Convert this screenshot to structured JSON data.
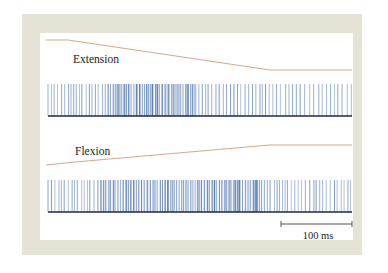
{
  "figure": {
    "panels": [
      {
        "id": "extension",
        "label": "Extension",
        "trace": {
          "color": "#d9a88a",
          "points": [
            [
              46,
              40
            ],
            [
              68,
              40
            ],
            [
              270,
              70
            ],
            [
              352,
              70
            ]
          ]
        },
        "spikes": {
          "color": "#5b7fb4",
          "baseline_color": "#1d2a44",
          "top": 84,
          "bottom": 116,
          "x_start": 48,
          "x_end": 352,
          "dense_region": [
            108,
            195
          ],
          "seed": 7
        }
      },
      {
        "id": "flexion",
        "label": "Flexion",
        "trace": {
          "color": "#d9a88a",
          "points": [
            [
              46,
              165
            ],
            [
              75,
              162
            ],
            [
              270,
              145
            ],
            [
              352,
              145
            ]
          ]
        },
        "spikes": {
          "color": "#5b7fb4",
          "baseline_color": "#1d2a44",
          "top": 180,
          "bottom": 212,
          "x_start": 48,
          "x_end": 352,
          "dense_region": [
            100,
            260
          ],
          "seed": 13
        }
      }
    ],
    "scale_bar": {
      "label": "100 ms",
      "x1": 281,
      "x2": 352,
      "y": 224,
      "color": "#555555"
    }
  },
  "chart_data": {
    "type": "line",
    "title": "",
    "series": [
      {
        "name": "Extension (joint position)",
        "shape": "flat, ramp down, flat"
      },
      {
        "name": "Flexion (joint position)",
        "shape": "flat, ramp up, flat"
      },
      {
        "name": "Extension spike train",
        "shape": "raster, higher firing rate early"
      },
      {
        "name": "Flexion spike train",
        "shape": "raster, high firing rate throughout"
      }
    ],
    "annotations": [
      "Extension",
      "Flexion",
      "100 ms"
    ],
    "scale_bar": "100 ms"
  }
}
